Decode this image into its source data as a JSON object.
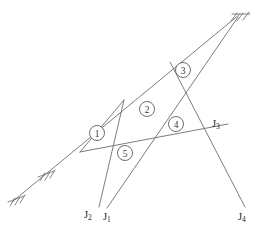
{
  "figure": {
    "name": "truss-frame-diagram",
    "type": "structural-line-diagram",
    "width": 265,
    "height": 232,
    "background_color": "#ffffff",
    "line_color": "#6e6e70",
    "text_color": "#1d1d1f"
  },
  "joints": [
    {
      "id": "J1",
      "label": "J",
      "subscript": "1"
    },
    {
      "id": "J2",
      "label": "J",
      "subscript": "2"
    },
    {
      "id": "J3",
      "label": "J",
      "subscript": "3"
    },
    {
      "id": "J4",
      "label": "J",
      "subscript": "4"
    }
  ],
  "panels": [
    {
      "id": "panel-1",
      "number": "1",
      "cx": 97,
      "cy": 133
    },
    {
      "id": "panel-2",
      "number": "2",
      "cx": 147,
      "cy": 109
    },
    {
      "id": "panel-3",
      "number": "3",
      "cx": 183,
      "cy": 70
    },
    {
      "id": "panel-4",
      "number": "4",
      "cx": 176,
      "cy": 124
    },
    {
      "id": "panel-5",
      "number": "5",
      "cx": 125,
      "cy": 153
    }
  ],
  "members": [
    {
      "id": "main-diagonal",
      "x1": 12,
      "y1": 202,
      "x2": 240,
      "y2": 14
    },
    {
      "id": "chord-j3",
      "x1": 80,
      "y1": 152,
      "x2": 228,
      "y2": 124
    },
    {
      "id": "web-j1-upper",
      "x1": 107,
      "y1": 208,
      "x2": 238,
      "y2": 17
    },
    {
      "id": "web-j2-upper",
      "x1": 99,
      "y1": 207,
      "x2": 124,
      "y2": 100
    },
    {
      "id": "web-j4-upper",
      "x1": 245,
      "y1": 207,
      "x2": 170,
      "y2": 62
    },
    {
      "id": "web-lower-tie",
      "x1": 80,
      "y1": 152,
      "x2": 124,
      "y2": 100
    }
  ],
  "supports": [
    {
      "id": "support-lower-left",
      "x": 14,
      "y": 200,
      "type": "hatched-fixed"
    },
    {
      "id": "support-lower-mid",
      "x": 44,
      "y": 175,
      "type": "hatched-fixed"
    },
    {
      "id": "support-upper-right",
      "x": 236,
      "y": 17,
      "type": "hatched-fixed"
    }
  ]
}
